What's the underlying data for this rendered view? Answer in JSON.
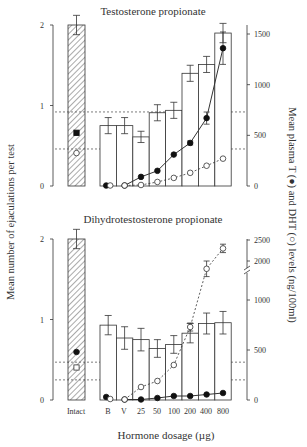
{
  "figure": {
    "left_axis_label": "Mean number of ejaculations per test",
    "right_axis_label": "Mean plasma T (●) and DHT (○) levels (ng/100ml)",
    "x_axis_label": "Hormone dosage (µg)",
    "x_tick_labels": [
      "Intact",
      "B",
      "V",
      "25",
      "50",
      "100",
      "200",
      "400",
      "800"
    ],
    "colors": {
      "ink": "#333333",
      "bar_fill": "#ffffff",
      "hatch": "#555555",
      "dotted_line": "#444444"
    }
  },
  "chart_data": [
    {
      "type": "bar",
      "title": "Testosterone propionate",
      "categories": [
        "Intact",
        "B",
        "V",
        "25",
        "50",
        "100",
        "200",
        "400",
        "800"
      ],
      "xlabel": "Hormone dosage (µg)",
      "ylabel": "Mean number of ejaculations per test",
      "ylim": [
        0,
        2
      ],
      "left_ticks": [
        0,
        1,
        2
      ],
      "y2label": "Mean plasma T (●) and DHT (○) levels (ng/100ml)",
      "y2lim": [
        0,
        1600
      ],
      "right_ticks": [
        0,
        500,
        1000,
        1500
      ],
      "series": [
        {
          "name": "Ejaculations (bars)",
          "values": [
            2.0,
            0.75,
            0.75,
            0.61,
            0.91,
            0.94,
            1.4,
            1.51,
            1.9
          ],
          "errors": [
            0.12,
            0.1,
            0.1,
            0.07,
            0.1,
            0.1,
            0.1,
            0.1,
            0.12
          ]
        },
        {
          "name": "Plasma T (●)",
          "values": [
            525,
            5,
            5,
            90,
            150,
            310,
            425,
            670,
            1360
          ],
          "errors": [
            0,
            0,
            0,
            0,
            0,
            0,
            20,
            60,
            160
          ],
          "line": "solid"
        },
        {
          "name": "Plasma DHT (○)",
          "values": [
            325,
            5,
            5,
            10,
            40,
            80,
            130,
            200,
            270
          ],
          "errors": [
            0,
            0,
            0,
            0,
            0,
            0,
            0,
            0,
            0
          ],
          "line": "dashed"
        }
      ],
      "reference_lines_left_units": [
        0.92,
        0.46
      ],
      "grid": false,
      "legend": "none (symbols described in right axis label)"
    },
    {
      "type": "bar",
      "title": "Dihydrotestosterone propionate",
      "categories": [
        "Intact",
        "B",
        "V",
        "25",
        "50",
        "100",
        "200",
        "400",
        "800"
      ],
      "xlabel": "Hormone dosage (µg)",
      "ylabel": "Mean number of ejaculations per test",
      "ylim": [
        0,
        2
      ],
      "left_ticks": [
        0,
        1,
        2
      ],
      "y2label": "Mean plasma T (●) and DHT (○) levels (ng/100ml)",
      "y2_axis_break": "between 1000 and 2000",
      "right_ticks": [
        0,
        500,
        1000,
        2000,
        2500
      ],
      "series": [
        {
          "name": "Ejaculations (bars)",
          "values": [
            2.0,
            0.93,
            0.77,
            0.75,
            0.64,
            0.69,
            0.83,
            0.95,
            0.96
          ],
          "errors": [
            0.12,
            0.12,
            0.14,
            0.14,
            0.11,
            0.11,
            0.12,
            0.13,
            0.14
          ]
        },
        {
          "name": "Plasma T (●)",
          "values": [
            480,
            30,
            5,
            5,
            20,
            40,
            40,
            55,
            70
          ],
          "errors": [
            0,
            0,
            0,
            0,
            0,
            0,
            0,
            0,
            0
          ],
          "line": "solid"
        },
        {
          "name": "Plasma DHT (○)",
          "values": [
            325,
            10,
            5,
            130,
            190,
            350,
            730,
            1800,
            2300
          ],
          "errors": [
            0,
            0,
            0,
            0,
            0,
            0,
            40,
            200,
            100
          ],
          "line": "dashed"
        }
      ],
      "reference_lines_left_units": [
        0.47,
        0.25
      ],
      "grid": false,
      "legend": "none (symbols described in right axis label)"
    }
  ]
}
